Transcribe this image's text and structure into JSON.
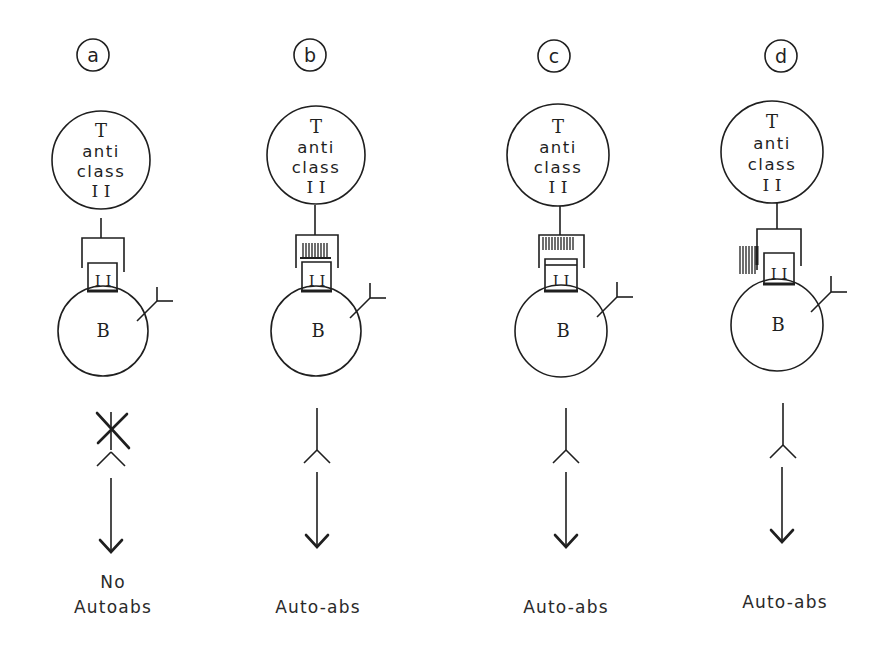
{
  "figure": {
    "panels": [
      {
        "id": "a",
        "label": "a",
        "t_cell": {
          "line1": "T",
          "line2": "anti",
          "line3": "class",
          "line4": "I I"
        },
        "mhc_label": "I I",
        "b_cell_label": "B",
        "receptor_pattern": "none",
        "blocked": true,
        "outcome_line1": "No",
        "outcome_line2": "Autoabs"
      },
      {
        "id": "b",
        "label": "b",
        "t_cell": {
          "line1": "T",
          "line2": "anti",
          "line3": "class",
          "line4": "I I"
        },
        "mhc_label": "I I",
        "b_cell_label": "B",
        "receptor_pattern": "hatched-inside",
        "blocked": false,
        "outcome_line1": "",
        "outcome_line2": "Auto-abs"
      },
      {
        "id": "c",
        "label": "c",
        "t_cell": {
          "line1": "T",
          "line2": "anti",
          "line3": "class",
          "line4": "I I"
        },
        "mhc_label": "I I",
        "b_cell_label": "B",
        "receptor_pattern": "hatched-top",
        "blocked": false,
        "outcome_line1": "",
        "outcome_line2": "Auto-abs"
      },
      {
        "id": "d",
        "label": "d",
        "t_cell": {
          "line1": "T",
          "line2": "anti",
          "line3": "class",
          "line4": "I I"
        },
        "mhc_label": "I I",
        "b_cell_label": "B",
        "receptor_pattern": "hatched-side",
        "blocked": false,
        "outcome_line1": "",
        "outcome_line2": "Auto-abs"
      }
    ]
  }
}
